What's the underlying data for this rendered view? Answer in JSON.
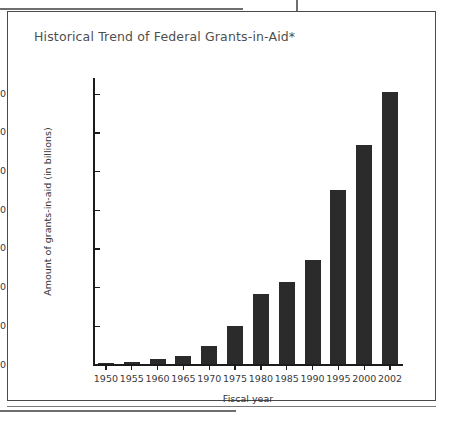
{
  "figure": {
    "title": "Historical Trend of Federal Grants-in-Aid*"
  },
  "chart_data": {
    "type": "bar",
    "title": "Historical Trend of Federal Grants-in-Aid*",
    "xlabel": "Fiscal year",
    "ylabel": "Amount of grants-in-aid (in billions)",
    "categories": [
      "1950",
      "1955",
      "1960",
      "1965",
      "1970",
      "1975",
      "1980",
      "1985",
      "1990",
      "1995",
      "2000",
      "2002"
    ],
    "values": [
      2,
      3,
      7,
      11,
      24,
      50,
      91,
      106,
      135,
      225,
      284,
      352
    ],
    "ylim": [
      0,
      350
    ],
    "yticks": [
      0,
      50,
      100,
      150,
      200,
      250,
      300,
      350
    ],
    "ytick_labels": [
      "0",
      "50",
      "100",
      "150",
      "200",
      "250",
      "300",
      "350"
    ],
    "grid": false,
    "legend": null,
    "bar_color": "#2b2b2b"
  }
}
